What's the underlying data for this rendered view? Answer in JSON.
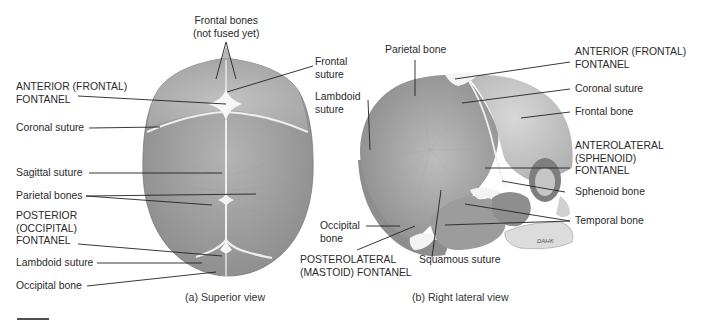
{
  "figure": {
    "superior_view": {
      "caption": "(a) Superior view",
      "labels": {
        "frontal_bones": "Frontal bones\n(not fused yet)",
        "frontal_suture": "Frontal\nsuture",
        "anterior_fontanel": "ANTERIOR (FRONTAL)\nFONTANEL",
        "coronal_suture": "Coronal suture",
        "sagittal_suture": "Sagittal suture",
        "parietal_bones": "Parietal bones",
        "posterior_fontanel": "POSTERIOR\n(OCCIPITAL)\nFONTANEL",
        "lambdoid_suture": "Lambdoid suture",
        "occipital_bone": "Occipital bone"
      }
    },
    "lateral_view": {
      "caption": "(b) Right lateral view",
      "labels": {
        "parietal_bone": "Parietal bone",
        "lambdoid_suture": "Lambdoid\nsuture",
        "anterior_fontanel": "ANTERIOR (FRONTAL)\nFONTANEL",
        "coronal_suture": "Coronal suture",
        "frontal_bone": "Frontal bone",
        "anterolateral_fontanel": "ANTEROLATERAL\n(SPHENOID)\nFONTANEL",
        "sphenoid_bone": "Sphenoid bone",
        "temporal_bone": "Temporal bone",
        "occipital_bone": "Occipital\nbone",
        "posterolateral_fontanel": "POSTEROLATERAL\n(MASTOID) FONTANEL",
        "squamous_suture": "Squamous suture",
        "artist_signature": "DAHK"
      }
    },
    "colors": {
      "bone_dark": "#8a8a8a",
      "bone_mid": "#a6a6a6",
      "bone_light": "#c9c9c9",
      "fontanel": "#f4f4f4",
      "leader_line": "#222222"
    }
  }
}
